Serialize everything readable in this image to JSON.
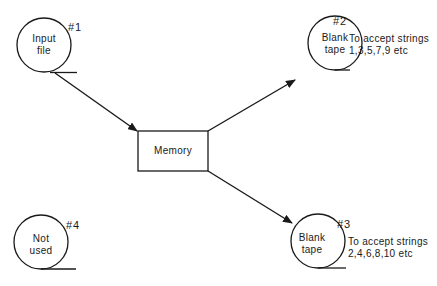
{
  "nodes": {
    "input_file": {
      "label_line1": "Input",
      "label_line2": "file",
      "number": "#1"
    },
    "blank_tape_2": {
      "label_line1": "Blank",
      "label_line2": "tape",
      "number": "#2",
      "note_line1": "To accept strings",
      "note_line2": "1,3,5,7,9 etc"
    },
    "blank_tape_3": {
      "label_line1": "Blank",
      "label_line2": "tape",
      "number": "#3",
      "note_line1": "To accept strings",
      "note_line2": "2,4,6,8,10 etc"
    },
    "not_used_4": {
      "label_line1": "Not",
      "label_line2": "used",
      "number": "#4"
    },
    "memory": {
      "label": "Memory"
    }
  },
  "edges": [
    {
      "from": "input_file",
      "to": "memory"
    },
    {
      "from": "memory",
      "to": "blank_tape_2"
    },
    {
      "from": "memory",
      "to": "blank_tape_3"
    }
  ],
  "colors": {
    "stroke": "#1a1a1a",
    "background": "#ffffff"
  }
}
